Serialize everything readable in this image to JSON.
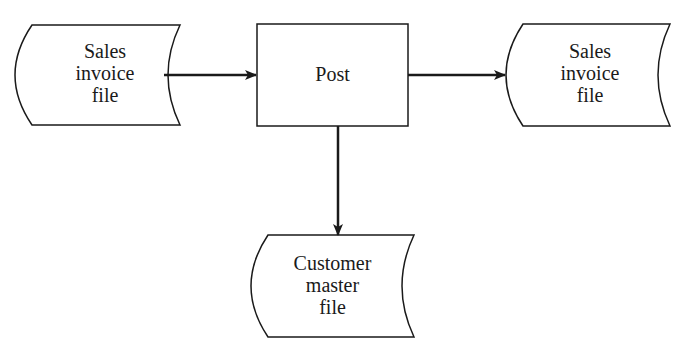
{
  "diagram": {
    "type": "flowchart",
    "header_cropped": "",
    "nodes": {
      "input_file": {
        "kind": "file",
        "label_lines": [
          "Sales",
          "invoice",
          "file"
        ]
      },
      "process": {
        "kind": "process",
        "label": "Post"
      },
      "output_file": {
        "kind": "file",
        "label_lines": [
          "Sales",
          "invoice",
          "file"
        ]
      },
      "master_file": {
        "kind": "file",
        "label_lines": [
          "Customer",
          "master",
          "file"
        ]
      }
    },
    "edges": [
      {
        "from": "input_file",
        "to": "process"
      },
      {
        "from": "process",
        "to": "output_file"
      },
      {
        "from": "process",
        "to": "master_file"
      }
    ],
    "colors": {
      "stroke": "#1a1a1a",
      "background": "#ffffff"
    }
  }
}
